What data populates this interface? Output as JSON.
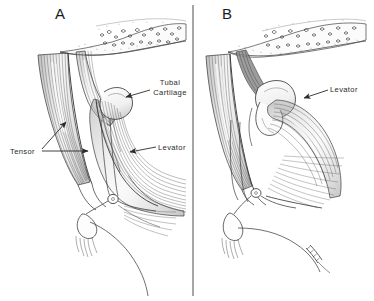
{
  "figure": {
    "type": "anatomical-illustration",
    "medium": "pen-and-ink line drawing",
    "background_color": "#ffffff",
    "ink_color": "#333333",
    "width": 374,
    "height": 301,
    "divider": {
      "orientation": "vertical",
      "x": 193,
      "color": "#5a5a5a"
    }
  },
  "panels": [
    {
      "id": "A",
      "letter": "A",
      "letter_x": 55,
      "letter_y": 6,
      "labels": [
        {
          "key": "tubal_cartilage",
          "text": "Tubal Cartilage",
          "line1": "Tubal",
          "line2": "Cartilage",
          "x": 152,
          "y": 80,
          "leader": {
            "from_x": 150,
            "from_y": 88,
            "to_x": 124,
            "to_y": 97,
            "arrow": true
          }
        },
        {
          "key": "tensor",
          "text": "Tensor",
          "x": 10,
          "y": 147,
          "leader": {
            "from_x": 42,
            "from_y": 151,
            "to_x": 88,
            "to_y": 151,
            "arrow": true
          },
          "leader2": {
            "from_x": 42,
            "from_y": 149,
            "to_x": 68,
            "to_y": 120,
            "arrow": true
          }
        },
        {
          "key": "levator",
          "text": "Levator",
          "x": 158,
          "y": 144,
          "leader": {
            "from_x": 156,
            "from_y": 148,
            "to_x": 128,
            "to_y": 152,
            "arrow": true
          }
        }
      ]
    },
    {
      "id": "B",
      "letter": "B",
      "letter_x": 222,
      "letter_y": 6,
      "labels": [
        {
          "key": "levator",
          "text": "Levator",
          "x": 330,
          "y": 86,
          "leader": {
            "from_x": 328,
            "from_y": 90,
            "to_x": 302,
            "to_y": 97,
            "arrow": true
          }
        }
      ]
    }
  ],
  "structures": [
    {
      "name": "palatal-mucosa-stipple",
      "panel": "A",
      "description": "stippled glandular mucosa band across top"
    },
    {
      "name": "tensor-veli-palatini-muscle",
      "panel": "A",
      "description": "broad striated fan-shaped muscle, left"
    },
    {
      "name": "levator-veli-palatini-muscle",
      "panel": "A",
      "description": "striated muscle fanning to lower right"
    },
    {
      "name": "tubal-cartilage",
      "panel": "A",
      "description": "hook-shaped cartilage outline, center"
    },
    {
      "name": "tendon-hamulus",
      "panel": "A",
      "description": "tendon passing around pterygoid hamulus"
    },
    {
      "name": "palatal-mucosa-stipple",
      "panel": "B",
      "description": "stippled glandular mucosa band across top"
    },
    {
      "name": "tensor-veli-palatini-muscle",
      "panel": "B",
      "description": "striated muscle, left"
    },
    {
      "name": "tubal-cartilage",
      "panel": "B",
      "description": "cartilage mass, center"
    },
    {
      "name": "levator-veli-palatini-muscle",
      "panel": "B",
      "description": "striated muscle fanning right"
    },
    {
      "name": "pterygoid-hamulus",
      "panel": "B",
      "description": "small ring at tendon pivot"
    }
  ]
}
